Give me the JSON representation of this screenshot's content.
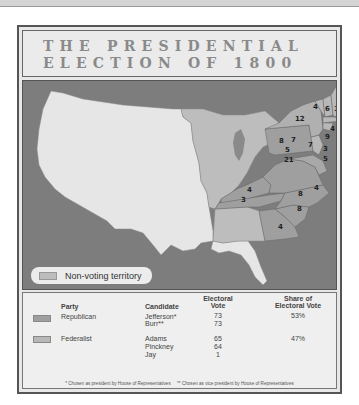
{
  "title": {
    "line1": "THE PRESIDENTIAL",
    "line2": "ELECTION OF 1800"
  },
  "map": {
    "legend_label": "Non-voting territory",
    "colors": {
      "water": "#7d7d7d",
      "non_voting": "#e6e6e6",
      "republican": "#9f9f9f",
      "federalist": "#b8b8b8",
      "territory": "#bdbdbd"
    },
    "state_votes": [
      {
        "state": "Vermont",
        "votes": "4"
      },
      {
        "state": "New Hampshire",
        "votes": "6"
      },
      {
        "state": "Massachusetts",
        "votes": "16"
      },
      {
        "state": "New York",
        "votes": "12"
      },
      {
        "state": "Rhode Island",
        "votes": "4"
      },
      {
        "state": "Connecticut",
        "votes": "9"
      },
      {
        "state": "Pennsylvania (west)",
        "votes": "8"
      },
      {
        "state": "Pennsylvania (east)",
        "votes": "7"
      },
      {
        "state": "New Jersey",
        "votes": "7"
      },
      {
        "state": "Delaware",
        "votes": "3"
      },
      {
        "state": "Maryland",
        "votes": "5"
      },
      {
        "state": "Maryland (east)",
        "votes": "5"
      },
      {
        "state": "Virginia",
        "votes": "21"
      },
      {
        "state": "Kentucky",
        "votes": "4"
      },
      {
        "state": "Tennessee",
        "votes": "3"
      },
      {
        "state": "North Carolina",
        "votes": "8"
      },
      {
        "state": "North Carolina (coast)",
        "votes": "4"
      },
      {
        "state": "South Carolina",
        "votes": "8"
      },
      {
        "state": "Georgia",
        "votes": "4"
      }
    ]
  },
  "table": {
    "headers": {
      "party": "Party",
      "candidate": "Candidate",
      "electoral_vote_1": "Electoral",
      "electoral_vote_2": "Vote",
      "share_1": "Share of",
      "share_2": "Electoral Vote"
    },
    "rows": [
      {
        "party": "Republican",
        "candidates": [
          "Jefferson*",
          "Burr**"
        ],
        "votes": [
          "73",
          "73"
        ],
        "share": "53%"
      },
      {
        "party": "Federalist",
        "candidates": [
          "Adams",
          "Pinckney",
          "Jay"
        ],
        "votes": [
          "65",
          "64",
          "1"
        ],
        "share": "47%"
      }
    ],
    "footnote_1": "* Chosen as president by House of Representatives",
    "footnote_2": "** Chosen as vice president by House of Representatives"
  }
}
